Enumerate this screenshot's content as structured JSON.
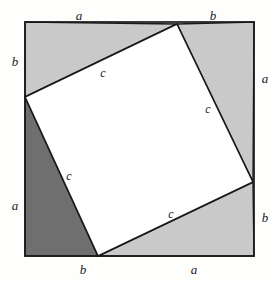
{
  "figure": {
    "kind": "geometry-diagram",
    "background_color": "#fefefd",
    "outline_color": "#1a1a1a",
    "inner_square_fill": "#ffffff",
    "triangle_fill_light": "#c9c9c9",
    "triangle_fill_dark": "#6f6f6f"
  },
  "outer_square": {
    "name": "outer-square",
    "corners": {
      "top_left": [
        25,
        22
      ],
      "top_right": [
        254,
        22
      ],
      "bottom_right": [
        254,
        256
      ],
      "bottom_left": [
        25,
        256
      ]
    }
  },
  "inner_square": {
    "name": "inner-square",
    "vertices": {
      "top": [
        177,
        24
      ],
      "right": [
        253,
        182
      ],
      "bottom": [
        98,
        256
      ],
      "left": [
        25,
        97
      ]
    }
  },
  "triangles": [
    {
      "name": "triangle-top",
      "points": "25,22 177,24 25,97",
      "fill": "#c9c9c9"
    },
    {
      "name": "triangle-right",
      "points": "177,24 254,22 253,182",
      "fill": "#c9c9c9"
    },
    {
      "name": "triangle-bottom",
      "points": "253,182 254,256 98,256",
      "fill": "#c9c9c9"
    },
    {
      "name": "triangle-left",
      "points": "25,97 98,256 25,256",
      "fill": "#6f6f6f"
    }
  ],
  "labels": {
    "top_a": {
      "text": "a",
      "x": 79,
      "y": 15
    },
    "top_b": {
      "text": "b",
      "x": 213,
      "y": 15
    },
    "left_b": {
      "text": "b",
      "x": 15,
      "y": 61
    },
    "left_a": {
      "text": "a",
      "x": 15,
      "y": 205
    },
    "right_a": {
      "text": "a",
      "x": 265,
      "y": 78
    },
    "right_b": {
      "text": "b",
      "x": 265,
      "y": 217
    },
    "bottom_b": {
      "text": "b",
      "x": 83,
      "y": 269
    },
    "bottom_a": {
      "text": "a",
      "x": 194,
      "y": 269
    },
    "c_top": {
      "text": "c",
      "x": 103,
      "y": 73
    },
    "c_right": {
      "text": "c",
      "x": 208,
      "y": 109
    },
    "c_left": {
      "text": "c",
      "x": 69,
      "y": 176
    },
    "c_bottom": {
      "text": "c",
      "x": 171,
      "y": 214
    }
  }
}
